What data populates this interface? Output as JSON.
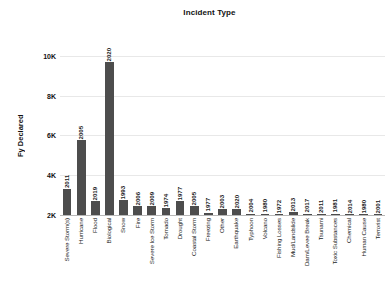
{
  "chart_data": {
    "type": "bar",
    "title": "Incident Type",
    "xlabel": "",
    "ylabel": "Fy Declared",
    "ylim": [
      2000,
      10800
    ],
    "grid": true,
    "legend": null,
    "ytick_labels": [
      "2K",
      "4K",
      "6K",
      "8K",
      "10K"
    ],
    "ytick_values": [
      2000,
      4000,
      6000,
      8000,
      10000
    ],
    "categories": [
      "Severe Storm(s)",
      "Hurricane",
      "Flood",
      "Biological",
      "Snow",
      "Fire",
      "Severe Ice Storm",
      "Tornado",
      "Drought",
      "Coastal Storm",
      "Freezing",
      "Other",
      "Earthquake",
      "Typhoon",
      "Volcano",
      "Fishing Losses",
      "Mud/Landslide",
      "Dam/Levee Break",
      "Tsunami",
      "Toxic Substances",
      "Chemical",
      "Human Cause",
      "Terrorist"
    ],
    "values": [
      3320,
      5760,
      2700,
      9700,
      2760,
      2450,
      2450,
      2340,
      2710,
      2430,
      2110,
      2300,
      2280,
      2060,
      2060,
      2055,
      2150,
      2075,
      2050,
      2075,
      2045,
      2040,
      2040
    ],
    "data_labels": [
      "2011",
      "2005",
      "2019",
      "2020",
      "1993",
      "2006",
      "2009",
      "1974",
      "1977",
      "2005",
      "1977",
      "2003",
      "2020",
      "2004",
      "1980",
      "1972",
      "2013",
      "2017",
      "2011",
      "1981",
      "2014",
      "1980",
      "2001"
    ],
    "bar_color": "#4d4d4d",
    "background_color": "#ffffff",
    "grid_color": "#e8e8e8"
  }
}
